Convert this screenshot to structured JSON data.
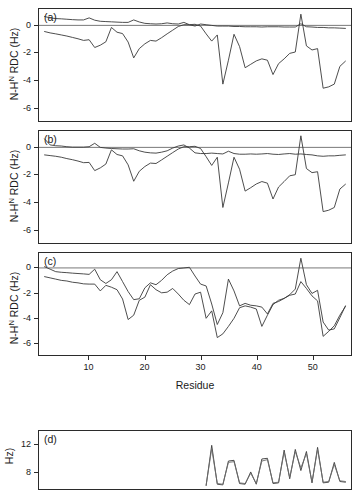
{
  "figure": {
    "xlabel": "Residue",
    "ylabel_main": "N-H",
    "ylabel_sup": "N",
    "ylabel_tail": " RDC (Hz)",
    "ylabel_d_tail": "Hz)"
  },
  "chart_data": [
    {
      "type": "line",
      "panel": "(a)",
      "title": "",
      "xlabel": "",
      "ylabel": "N-H^N RDC (Hz)",
      "xlim": [
        1,
        57
      ],
      "ylim": [
        -7,
        1.2
      ],
      "yticks": [
        0,
        -2,
        -4,
        -6
      ],
      "xticks": [
        10,
        20,
        30,
        40,
        50
      ],
      "grid": false,
      "zero_line": true,
      "legend": "none",
      "series": [
        {
          "name": "calculated",
          "color": "#3a3a3a",
          "x": [
            2,
            3,
            4,
            5,
            6,
            7,
            8,
            9,
            10,
            11,
            12,
            13,
            14,
            15,
            16,
            17,
            18,
            19,
            20,
            21,
            22,
            23,
            24,
            25,
            26,
            27,
            28,
            29,
            30,
            31,
            32,
            33,
            34,
            35,
            36,
            37,
            38,
            39,
            40,
            41,
            42,
            43,
            44,
            45,
            46,
            47,
            48,
            49,
            50,
            51,
            52,
            53,
            54,
            55,
            56
          ],
          "values": [
            0.65,
            0.55,
            0.5,
            0.48,
            0.45,
            0.42,
            0.4,
            0.4,
            0.55,
            0.38,
            0.3,
            0.28,
            0.26,
            0.24,
            0.22,
            0.22,
            0.4,
            0.25,
            0.15,
            0.12,
            0.1,
            0.12,
            0.18,
            0.12,
            0.1,
            0.22,
            0.05,
            -0.05,
            0.1,
            0.05,
            0.0,
            -0.05,
            -0.05,
            -0.05,
            -0.08,
            -0.08,
            -0.1,
            -0.1,
            -0.1,
            -0.12,
            -0.1,
            -0.1,
            -0.1,
            -0.12,
            -0.12,
            -0.12,
            0.12,
            -0.1,
            -0.12,
            -0.15,
            -0.15,
            -0.18,
            -0.18,
            -0.2,
            -0.22
          ]
        },
        {
          "name": "experimental",
          "color": "#3a3a3a",
          "x": [
            2,
            3,
            4,
            5,
            6,
            7,
            8,
            9,
            10,
            11,
            12,
            13,
            14,
            15,
            16,
            17,
            18,
            19,
            20,
            21,
            22,
            23,
            24,
            25,
            26,
            27,
            28,
            29,
            30,
            31,
            32,
            33,
            34,
            35,
            36,
            37,
            38,
            39,
            40,
            41,
            42,
            43,
            44,
            45,
            46,
            47,
            48,
            49,
            50,
            51,
            52,
            53,
            54,
            55,
            56
          ],
          "values": [
            -0.45,
            -0.55,
            -0.62,
            -0.7,
            -0.78,
            -0.88,
            -0.98,
            -1.1,
            -1.05,
            -1.62,
            -1.45,
            -1.2,
            -0.15,
            -0.5,
            -0.6,
            -1.22,
            -2.38,
            -1.7,
            -1.35,
            -1.1,
            -1.15,
            -0.9,
            -0.62,
            -0.35,
            -0.08,
            0.05,
            0.05,
            0.08,
            -0.05,
            -0.62,
            -1.15,
            -0.7,
            -4.3,
            -2.55,
            -0.65,
            -1.55,
            -3.1,
            -2.85,
            -2.6,
            -2.45,
            -2.55,
            -3.6,
            -2.8,
            -2.45,
            -2.05,
            -1.95,
            0.82,
            -1.5,
            -1.8,
            -1.7,
            -4.6,
            -4.5,
            -4.3,
            -3.0,
            -2.62
          ]
        }
      ]
    },
    {
      "type": "line",
      "panel": "(b)",
      "title": "",
      "xlabel": "",
      "ylabel": "N-H^N RDC (Hz)",
      "xlim": [
        1,
        57
      ],
      "ylim": [
        -7,
        1.2
      ],
      "yticks": [
        0,
        -2,
        -4,
        -6
      ],
      "xticks": [
        10,
        20,
        30,
        40,
        50
      ],
      "grid": false,
      "zero_line": true,
      "legend": "none",
      "series": [
        {
          "name": "calculated",
          "color": "#3a3a3a",
          "x": [
            2,
            3,
            4,
            5,
            6,
            7,
            8,
            9,
            10,
            11,
            12,
            13,
            14,
            15,
            16,
            17,
            18,
            19,
            20,
            21,
            22,
            23,
            24,
            25,
            26,
            27,
            28,
            29,
            30,
            31,
            32,
            33,
            34,
            35,
            36,
            37,
            38,
            39,
            40,
            41,
            42,
            43,
            44,
            45,
            46,
            47,
            48,
            49,
            50,
            51,
            52,
            53,
            54,
            55,
            56
          ],
          "values": [
            0.62,
            0.18,
            0.12,
            0.1,
            0.05,
            0.02,
            0.02,
            0.02,
            0.05,
            0.3,
            0.0,
            -0.05,
            -0.08,
            -0.1,
            -0.12,
            -0.12,
            -0.1,
            -0.25,
            -0.35,
            -0.4,
            -0.42,
            -0.35,
            -0.25,
            -0.05,
            0.1,
            0.18,
            -0.05,
            -0.4,
            -0.45,
            -0.45,
            -0.42,
            -0.45,
            -0.48,
            -0.28,
            -0.45,
            -0.5,
            -0.5,
            -0.48,
            -0.5,
            -0.48,
            -0.45,
            -0.5,
            -0.52,
            -0.48,
            -0.45,
            -0.5,
            -0.48,
            -0.52,
            -0.55,
            -0.62,
            -0.65,
            -0.62,
            -0.62,
            -0.58,
            -0.55
          ]
        },
        {
          "name": "experimental",
          "color": "#3a3a3a",
          "x": [
            2,
            3,
            4,
            5,
            6,
            7,
            8,
            9,
            10,
            11,
            12,
            13,
            14,
            15,
            16,
            17,
            18,
            19,
            20,
            21,
            22,
            23,
            24,
            25,
            26,
            27,
            28,
            29,
            30,
            31,
            32,
            33,
            34,
            35,
            36,
            37,
            38,
            39,
            40,
            41,
            42,
            43,
            44,
            45,
            46,
            47,
            48,
            49,
            50,
            51,
            52,
            53,
            54,
            55,
            56
          ],
          "values": [
            -0.55,
            -0.6,
            -0.65,
            -0.72,
            -0.82,
            -0.9,
            -1.0,
            -1.12,
            -1.1,
            -1.7,
            -1.5,
            -1.22,
            -0.18,
            -0.52,
            -0.62,
            -1.28,
            -2.48,
            -1.75,
            -1.4,
            -1.15,
            -1.18,
            -0.92,
            -0.65,
            -0.38,
            -0.12,
            0.05,
            0.05,
            0.08,
            -0.08,
            -0.68,
            -1.32,
            -0.72,
            -4.4,
            -2.6,
            -0.72,
            -1.6,
            -3.2,
            -2.95,
            -2.68,
            -2.5,
            -2.62,
            -3.78,
            -2.9,
            -2.5,
            -2.08,
            -2.0,
            0.85,
            -1.55,
            -1.85,
            -1.78,
            -4.7,
            -4.6,
            -4.4,
            -3.05,
            -2.7
          ]
        }
      ]
    },
    {
      "type": "line",
      "panel": "(c)",
      "title": "",
      "xlabel": "Residue",
      "ylabel": "N-H^N RDC (Hz)",
      "xlim": [
        1,
        57
      ],
      "ylim": [
        -7,
        1.2
      ],
      "yticks": [
        0,
        -2,
        -4,
        -6
      ],
      "xticks": [
        10,
        20,
        30,
        40,
        50
      ],
      "grid": false,
      "zero_line": true,
      "legend": "none",
      "series": [
        {
          "name": "calculated",
          "color": "#3a3a3a",
          "x": [
            2,
            3,
            4,
            5,
            6,
            7,
            8,
            9,
            10,
            11,
            12,
            13,
            14,
            15,
            16,
            17,
            18,
            19,
            20,
            21,
            22,
            23,
            24,
            25,
            26,
            27,
            28,
            29,
            30,
            31,
            32,
            33,
            34,
            35,
            36,
            37,
            38,
            39,
            40,
            41,
            42,
            43,
            44,
            45,
            46,
            47,
            48,
            49,
            50,
            51,
            52,
            53,
            54,
            55,
            56
          ],
          "values": [
            0.1,
            -0.1,
            -0.3,
            -0.35,
            -0.38,
            -0.42,
            -0.45,
            -0.48,
            -0.52,
            -0.1,
            -0.95,
            -1.25,
            -0.95,
            -0.3,
            -1.1,
            -1.9,
            -2.55,
            -2.48,
            -1.6,
            -1.2,
            -1.35,
            -1.0,
            -0.55,
            -0.25,
            -0.05,
            0.0,
            0.05,
            -0.65,
            -1.3,
            -1.45,
            -2.9,
            -4.55,
            -3.6,
            -0.9,
            -1.85,
            -3.05,
            -2.85,
            -3.0,
            -3.05,
            -3.15,
            -3.7,
            -2.85,
            -2.7,
            -2.45,
            -2.15,
            -1.7,
            0.78,
            -1.35,
            -2.05,
            -1.8,
            -4.35,
            -5.0,
            -4.9,
            -4.0,
            -3.05
          ]
        },
        {
          "name": "experimental",
          "color": "#3a3a3a",
          "x": [
            2,
            3,
            4,
            5,
            6,
            7,
            8,
            9,
            10,
            11,
            12,
            13,
            14,
            15,
            16,
            17,
            18,
            19,
            20,
            21,
            22,
            23,
            24,
            25,
            26,
            27,
            28,
            29,
            30,
            31,
            32,
            33,
            34,
            35,
            36,
            37,
            38,
            39,
            40,
            41,
            42,
            43,
            44,
            45,
            46,
            47,
            48,
            49,
            50,
            51,
            52,
            53,
            54,
            55,
            56
          ],
          "values": [
            -0.7,
            -0.8,
            -0.9,
            -1.0,
            -1.05,
            -1.15,
            -1.2,
            -1.28,
            -1.3,
            -1.3,
            -1.85,
            -1.4,
            -1.55,
            -1.75,
            -2.5,
            -4.15,
            -3.8,
            -2.6,
            -2.35,
            -1.35,
            -1.75,
            -2.0,
            -1.95,
            -1.65,
            -2.1,
            -2.6,
            -2.95,
            -2.1,
            -1.95,
            -4.05,
            -3.45,
            -5.6,
            -5.3,
            -4.7,
            -4.05,
            -3.2,
            -3.05,
            -3.15,
            -3.3,
            -4.7,
            -3.8,
            -2.95,
            -2.6,
            -2.45,
            -2.2,
            -2.1,
            -1.1,
            -1.65,
            -2.25,
            -2.65,
            -5.5,
            -5.1,
            -4.65,
            -3.8,
            -3.1
          ]
        }
      ]
    },
    {
      "type": "line",
      "panel": "(d)",
      "title": "",
      "xlabel": "",
      "ylabel": "Hz)",
      "xlim": [
        1,
        57
      ],
      "ylim": [
        5.5,
        14
      ],
      "yticks": [
        12,
        8
      ],
      "xticks": [],
      "grid": false,
      "zero_line": false,
      "legend": "none",
      "series": [
        {
          "name": "series-1",
          "color": "#3a3a3a",
          "x": [
            31,
            32,
            33,
            34,
            35,
            36,
            37,
            38,
            39,
            40,
            41,
            42,
            43,
            44,
            45,
            46,
            47,
            48,
            49,
            50,
            51,
            52,
            53,
            54,
            55,
            56
          ],
          "values": [
            6.0,
            11.9,
            6.2,
            6.1,
            9.6,
            9.7,
            6.3,
            6.2,
            8.0,
            6.2,
            9.9,
            10.0,
            6.3,
            6.4,
            11.2,
            7.0,
            11.3,
            8.2,
            11.0,
            6.4,
            11.6,
            6.4,
            6.5,
            9.4,
            6.6,
            6.5
          ]
        },
        {
          "name": "series-2",
          "color": "#6b6b6b",
          "x": [
            31,
            32,
            33,
            34,
            35,
            36,
            37,
            38,
            39,
            40,
            41,
            42,
            43,
            44,
            45,
            46,
            47,
            48,
            49,
            50,
            51,
            52,
            53,
            54,
            55,
            56
          ],
          "values": [
            6.1,
            11.4,
            6.3,
            6.2,
            9.4,
            9.5,
            6.4,
            6.3,
            7.8,
            6.3,
            9.6,
            9.8,
            6.4,
            6.5,
            10.9,
            7.2,
            11.0,
            8.6,
            10.7,
            6.5,
            11.3,
            6.5,
            6.6,
            9.1,
            6.7,
            6.6
          ]
        }
      ]
    }
  ]
}
